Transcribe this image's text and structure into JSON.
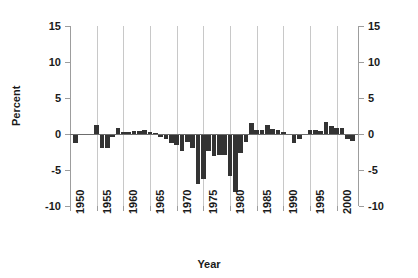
{
  "chart_data": {
    "type": "bar",
    "title": "",
    "xlabel": "Year",
    "ylabel": "Percent",
    "ylim": [
      -10,
      15
    ],
    "xlim": [
      1950,
      2004
    ],
    "grid": "vertical",
    "legend": "none",
    "bar_color": "#333333",
    "ytick_labels": [
      "15",
      "10",
      "5",
      "0",
      "-5",
      "-10"
    ],
    "ytick_values": [
      15,
      10,
      5,
      0,
      -5,
      -10
    ],
    "xtick_labels": [
      "1950",
      "1955",
      "1960",
      "1965",
      "1970",
      "1975",
      "1980",
      "1985",
      "1990",
      "1995",
      "2000"
    ],
    "xtick_values": [
      1950,
      1955,
      1960,
      1965,
      1970,
      1975,
      1980,
      1985,
      1990,
      1995,
      2000
    ],
    "categories": [
      1951,
      1952,
      1953,
      1954,
      1955,
      1956,
      1957,
      1958,
      1959,
      1960,
      1961,
      1962,
      1963,
      1964,
      1965,
      1966,
      1967,
      1968,
      1969,
      1970,
      1971,
      1972,
      1973,
      1974,
      1975,
      1976,
      1977,
      1978,
      1979,
      1980,
      1981,
      1982,
      1983,
      1984,
      1985,
      1986,
      1987,
      1988,
      1989,
      1990,
      1991,
      1992,
      1993,
      1994,
      1995,
      1996,
      1997,
      1998,
      1999,
      2000,
      2001,
      2002,
      2003
    ],
    "values": [
      -1.3,
      -0.2,
      0.0,
      0.0,
      1.3,
      -1.9,
      -2.0,
      -0.4,
      0.8,
      0.3,
      0.3,
      0.4,
      0.4,
      0.5,
      0.3,
      0.1,
      -0.4,
      -0.7,
      -1.3,
      -1.5,
      -2.4,
      -1.1,
      -1.9,
      -6.9,
      -6.3,
      -2.3,
      -3.1,
      -2.9,
      -2.9,
      -5.8,
      -8.1,
      -2.6,
      -1.1,
      1.5,
      0.6,
      0.5,
      1.2,
      0.7,
      0.5,
      0.3,
      -0.2,
      -1.3,
      -0.7,
      -0.2,
      0.5,
      0.5,
      0.4,
      1.6,
      1.1,
      0.9,
      0.8,
      -0.7,
      -1.0
    ],
    "right_axis": {
      "mirror": true
    }
  },
  "axis_titles": {
    "y": "Percent",
    "x": "Year"
  }
}
